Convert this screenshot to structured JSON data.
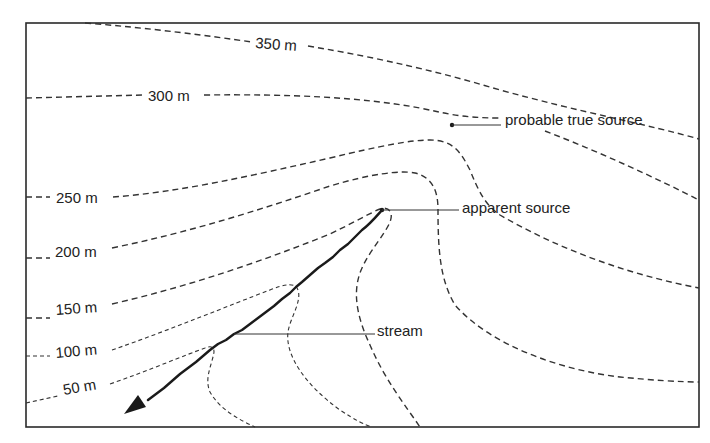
{
  "diagram": {
    "title": "",
    "contours": [
      {
        "label": "350 m",
        "value": 350
      },
      {
        "label": "300 m",
        "value": 300
      },
      {
        "label": "250 m",
        "value": 250
      },
      {
        "label": "200 m",
        "value": 200
      },
      {
        "label": "150 m",
        "value": 150
      },
      {
        "label": "100 m",
        "value": 100
      },
      {
        "label": "50 m",
        "value": 50
      }
    ],
    "callouts": {
      "probable_true_source": "probable true source",
      "apparent_source": "apparent source",
      "stream": "stream"
    },
    "colors": {
      "line": "#333333",
      "stream": "#1a1a1a",
      "background": "#ffffff"
    }
  }
}
